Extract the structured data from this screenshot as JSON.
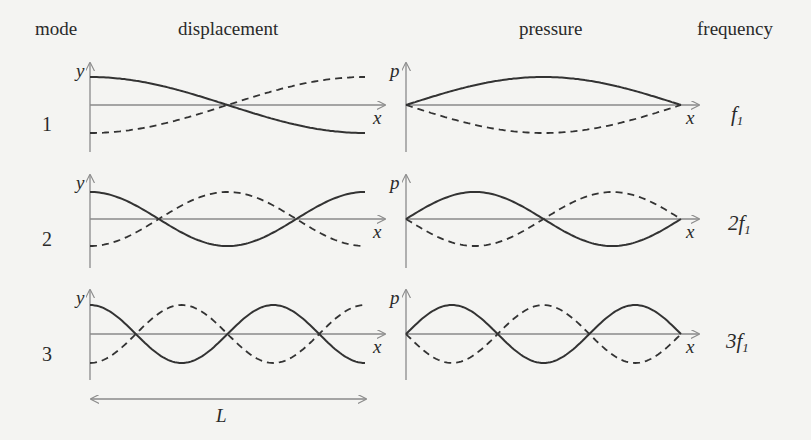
{
  "headers": {
    "mode": "mode",
    "displacement": "displacement",
    "pressure": "pressure",
    "frequency": "frequency"
  },
  "axis_labels": {
    "displacement_y": "y",
    "pressure_y": "p",
    "x": "x"
  },
  "length_label": "L",
  "rows": [
    {
      "mode": "1",
      "frequency_coeff": "",
      "frequency_symbol": "f",
      "frequency_sub": "1"
    },
    {
      "mode": "2",
      "frequency_coeff": "2",
      "frequency_symbol": "f",
      "frequency_sub": "1"
    },
    {
      "mode": "3",
      "frequency_coeff": "3",
      "frequency_symbol": "f",
      "frequency_sub": "1"
    }
  ],
  "chart_data": {
    "type": "line",
    "columns": [
      "mode",
      "displacement",
      "pressure",
      "frequency"
    ],
    "modes": [
      {
        "mode": 1,
        "frequency": "f1",
        "displacement": {
          "solid": "cos(1·πx/L)",
          "dashed": "-cos(1·πx/L)",
          "nodes_at_fraction_of_L": [
            0.5
          ]
        },
        "pressure": {
          "solid": "sin(1·πx/L)",
          "dashed": "-sin(1·πx/L)",
          "nodes_at_fraction_of_L": [
            0,
            1
          ]
        }
      },
      {
        "mode": 2,
        "frequency": "2f1",
        "displacement": {
          "solid": "cos(2·πx/L)",
          "dashed": "-cos(2·πx/L)",
          "nodes_at_fraction_of_L": [
            0.25,
            0.75
          ]
        },
        "pressure": {
          "solid": "sin(2·πx/L)",
          "dashed": "-sin(2·πx/L)",
          "nodes_at_fraction_of_L": [
            0,
            0.5,
            1
          ]
        }
      },
      {
        "mode": 3,
        "frequency": "3f1",
        "displacement": {
          "solid": "cos(3·πx/L)",
          "dashed": "-cos(3·πx/L)",
          "nodes_at_fraction_of_L": [
            0.1667,
            0.5,
            0.8333
          ]
        },
        "pressure": {
          "solid": "sin(3·πx/L)",
          "dashed": "-sin(3·πx/L)",
          "nodes_at_fraction_of_L": [
            0,
            0.3333,
            0.6667,
            1
          ]
        }
      }
    ],
    "xlabel": "x",
    "ylabels": [
      "y",
      "p"
    ],
    "length_marker": "L",
    "grid": false,
    "legend": "solid and dashed curves show opposite extremes of oscillation"
  },
  "colors": {
    "background": "#f4f4f2",
    "curve": "#333333",
    "axis": "#8a8a8a",
    "text": "#2a2a2a"
  }
}
